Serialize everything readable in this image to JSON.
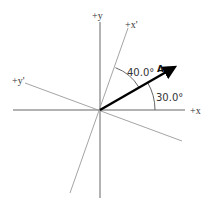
{
  "diagram": {
    "title": "",
    "axes": {
      "x": {
        "label": "+x"
      },
      "y": {
        "label": "+y"
      },
      "x_prime": {
        "label": "+x'"
      },
      "y_prime": {
        "label": "+y'"
      }
    },
    "vector": {
      "label": "A",
      "angle_from_x_deg": 30.0
    },
    "angles": [
      {
        "label": "30.0°",
        "between": [
          "+x",
          "A"
        ]
      },
      {
        "label": "40.0°",
        "between": [
          "A",
          "+x'"
        ]
      }
    ],
    "colors": {
      "axes": "#666666",
      "rotated_axes": "#9a9a9a",
      "vector": "#000000",
      "text": "#333333"
    }
  }
}
